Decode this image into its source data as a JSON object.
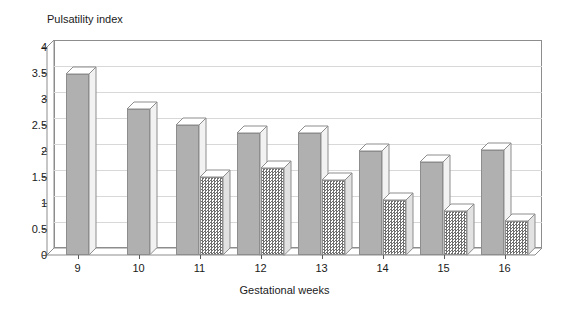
{
  "chart_data": {
    "type": "bar",
    "title": "",
    "ylabel": "Pulsatility index",
    "xlabel": "Gestational weeks",
    "categories": [
      "9",
      "10",
      "11",
      "12",
      "13",
      "14",
      "15",
      "16"
    ],
    "series": [
      {
        "name": "series-a",
        "style": "solid-gray",
        "values": [
          3.48,
          2.8,
          2.5,
          2.35,
          2.35,
          2.0,
          1.79,
          2.02
        ]
      },
      {
        "name": "series-b",
        "style": "hatched",
        "values": [
          null,
          null,
          1.5,
          1.68,
          1.44,
          1.06,
          0.85,
          0.65
        ]
      }
    ],
    "ylim": [
      0,
      4
    ],
    "yticks": [
      "0",
      "0.5",
      "1",
      "1.5",
      "2",
      "2.5",
      "3",
      "3.5",
      "4"
    ],
    "ytick_values": [
      0,
      0.5,
      1,
      1.5,
      2,
      2.5,
      3,
      3.5,
      4
    ],
    "grid": true,
    "legend": "none",
    "three_d": true,
    "colors": {
      "bar_solid": "#b0b0b0",
      "bar_hatch_dark": "#6e6e6e",
      "bar_outline": "#8d8d8d",
      "gridline": "#d8d8d8",
      "axis": "#5a5a5a",
      "text": "#1a1a1a",
      "background": "#ffffff"
    }
  }
}
